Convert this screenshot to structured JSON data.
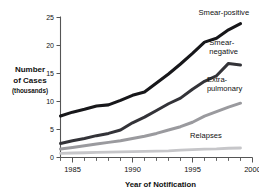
{
  "chart_data": {
    "type": "line",
    "title": "",
    "xlabel": "Year of Notification",
    "ylabel": "Number of Cases (thousands)",
    "ylabel_lines": [
      "Number",
      "of Cases",
      "(thousands)"
    ],
    "xlim": [
      1984,
      2000
    ],
    "ylim": [
      0,
      25
    ],
    "yticks": [
      0,
      5,
      10,
      15,
      20,
      25
    ],
    "ytick_labels": [
      "0",
      "5",
      "10",
      "15",
      "20",
      "25"
    ],
    "xticks": [
      1985,
      1990,
      1995,
      2000
    ],
    "xtick_labels": [
      "1985",
      "1990",
      "1995",
      "2000"
    ],
    "x_minor_ticks": [
      1984,
      1985,
      1986,
      1987,
      1988,
      1989,
      1990,
      1991,
      1992,
      1993,
      1994,
      1995,
      1996,
      1997,
      1998,
      1999,
      2000
    ],
    "grid": false,
    "legend_position": "inline-right",
    "x": [
      1984,
      1985,
      1986,
      1987,
      1988,
      1989,
      1990,
      1991,
      1992,
      1993,
      1994,
      1995,
      1996,
      1997,
      1998,
      1999
    ],
    "series": [
      {
        "name": "Smear-positive",
        "color": "#17171a",
        "width": 3.1,
        "values": [
          7.4,
          8.1,
          8.6,
          9.2,
          9.4,
          10.2,
          11.1,
          11.7,
          13.3,
          14.9,
          16.7,
          18.6,
          20.6,
          21.3,
          22.8,
          23.9
        ],
        "label_x": 1995.5,
        "label_y": 25.4
      },
      {
        "name": "Smear-negative",
        "color": "#333338",
        "width": 3.0,
        "values": [
          2.5,
          3.0,
          3.4,
          3.9,
          4.3,
          4.9,
          6.2,
          7.2,
          8.4,
          9.6,
          10.6,
          12.2,
          13.6,
          14.6,
          16.8,
          16.5
        ],
        "label_lines": [
          "Smear-",
          "negative"
        ],
        "label_x": 1996.4,
        "label_y": 20.1
      },
      {
        "name": "Extra-pulmonary",
        "color": "#9a9a9e",
        "width": 3.0,
        "values": [
          1.5,
          1.8,
          2.1,
          2.4,
          2.7,
          3.0,
          3.4,
          3.8,
          4.3,
          4.9,
          5.5,
          6.3,
          7.4,
          8.2,
          9.0,
          9.7
        ],
        "label_lines": [
          "Extra-",
          "pulmonary"
        ],
        "label_x": 1996.2,
        "label_y": 13.5
      },
      {
        "name": "Relapses",
        "color": "#c6c6c9",
        "width": 2.8,
        "values": [
          0.75,
          0.8,
          0.85,
          0.9,
          0.95,
          1.0,
          1.05,
          1.1,
          1.15,
          1.2,
          1.3,
          1.4,
          1.5,
          1.55,
          1.65,
          1.7
        ],
        "label_x": 1994.8,
        "label_y": 3.5
      }
    ]
  }
}
